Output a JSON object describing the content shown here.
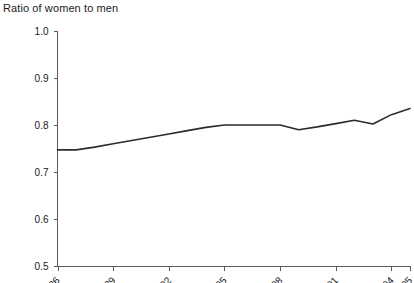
{
  "chart_data": {
    "type": "line",
    "title": "Ratio of women to men",
    "xlabel": "",
    "ylabel": "",
    "ylim": [
      0.5,
      1.0
    ],
    "ytick_values": [
      0.5,
      0.6,
      0.7,
      0.8,
      0.9,
      1.0
    ],
    "ytick_labels": [
      "0.5",
      "0.6",
      "0.7",
      "0.8",
      "0.9",
      "1.0"
    ],
    "grid": false,
    "legend": "none",
    "xtick_labels": [
      "86",
      "89",
      "92",
      "95",
      "98",
      "01",
      "04",
      "05"
    ],
    "xtick_rotated": true,
    "x": [
      "1986",
      "1987",
      "1988",
      "1989",
      "1990",
      "1991",
      "1992",
      "1993",
      "1994",
      "1995",
      "1996",
      "1997",
      "1998",
      "1999",
      "2000",
      "2001",
      "2002",
      "2003",
      "2004",
      "2005"
    ],
    "values": [
      0.747,
      0.747,
      0.753,
      0.76,
      0.767,
      0.774,
      0.781,
      0.788,
      0.795,
      0.8,
      0.8,
      0.8,
      0.8,
      0.79,
      0.796,
      0.803,
      0.81,
      0.802,
      0.822,
      0.835
    ],
    "series": [
      {
        "name": "Ratio of women to men",
        "color": "#2b2b2b",
        "values": [
          0.747,
          0.747,
          0.753,
          0.76,
          0.767,
          0.774,
          0.781,
          0.788,
          0.795,
          0.8,
          0.8,
          0.8,
          0.8,
          0.79,
          0.796,
          0.803,
          0.81,
          0.802,
          0.822,
          0.835
        ]
      }
    ]
  },
  "colors": {
    "axis": "#5a5a5a",
    "line": "#2b2b2b",
    "text": "#1b1b1b",
    "background": "#ffffff"
  }
}
